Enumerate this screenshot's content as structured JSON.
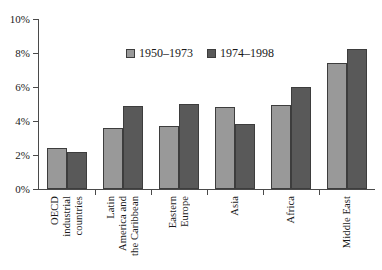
{
  "chart_data": {
    "type": "bar",
    "title": "",
    "subtitle": "",
    "xlabel": "",
    "ylabel": "",
    "ylim": [
      0,
      10
    ],
    "y_tick_labels": [
      "0%",
      "2%",
      "4%",
      "6%",
      "8%",
      "10%"
    ],
    "y_tick_values": [
      0,
      2,
      4,
      6,
      8,
      10
    ],
    "y_unit": "%",
    "grid": false,
    "legend_position": "inside-top-center",
    "categories": [
      "OECD industrial countries",
      "Latin America and the Caribbean",
      "Eastern Europe",
      "Asia",
      "Africa",
      "Middle East"
    ],
    "category_label_lines": [
      [
        "OECD",
        "industrial",
        "countries"
      ],
      [
        "Latin",
        "America and",
        "the Caribbean"
      ],
      [
        "Eastern",
        "Europe"
      ],
      [
        "Asia"
      ],
      [
        "Africa"
      ],
      [
        "Middle East"
      ]
    ],
    "series": [
      {
        "name": "1950–1973",
        "color": "#999999",
        "values": [
          2.4,
          3.6,
          3.7,
          4.85,
          4.95,
          7.4
        ]
      },
      {
        "name": "1974–1998",
        "color": "#595959",
        "values": [
          2.15,
          4.9,
          5.0,
          3.8,
          6.0,
          8.25
        ]
      }
    ],
    "annotations": []
  },
  "style": {
    "axis_color": "#4a4a4a",
    "bar_border_color": "#3d3d3d",
    "background": "#ffffff",
    "text_color": "#1a1a1a"
  }
}
